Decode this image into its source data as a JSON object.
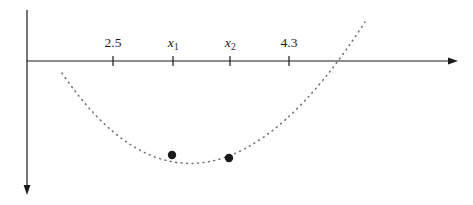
{
  "figure": {
    "name": "parabola-number-line-figure",
    "background_color": "#ffffff",
    "ink_color": "#1a1a1a",
    "curve_color": "#6b6b6b",
    "width": 473,
    "height": 205
  },
  "axes": {
    "horizontal": {
      "name": "x-axis",
      "y": 61,
      "x_start": 27,
      "x_end": 458,
      "arrow": "right"
    },
    "vertical": {
      "name": "y-axis",
      "x": 27,
      "y_start": 10,
      "y_end": 195,
      "arrow": "down"
    }
  },
  "ticks": [
    {
      "label": "2.5",
      "is_variable": false,
      "sub": "",
      "x": 113
    },
    {
      "label": "x",
      "is_variable": true,
      "sub": "1",
      "x": 173
    },
    {
      "label": "x",
      "is_variable": true,
      "sub": "2",
      "x": 230
    },
    {
      "label": "4.3",
      "is_variable": false,
      "sub": "",
      "x": 289
    }
  ],
  "tick_geometry": {
    "above": 5,
    "below": 5
  },
  "points": [
    {
      "name": "point-x1",
      "x": 172,
      "y": 155,
      "radius": 4.2
    },
    {
      "name": "point-x2",
      "x": 229,
      "y": 158,
      "radius": 4.2
    }
  ],
  "chart_data": {
    "type": "line",
    "title": "",
    "xlabel": "",
    "ylabel": "",
    "grid": false,
    "legend": null,
    "style": "dotted parabola opening upward, drawn below the x-axis",
    "tick_labels": [
      "2.5",
      "x_1",
      "x_2",
      "4.3"
    ],
    "tick_pixel_x": [
      113,
      173,
      230,
      289
    ],
    "curve": {
      "name": "dotted-parabola",
      "pixel_start": [
        62,
        73
      ],
      "pixel_end": [
        365,
        22
      ],
      "pixel_vertex": [
        207,
        162
      ],
      "dash_pattern": "0.9 4.6"
    },
    "marked_points": [
      {
        "label": "x_1",
        "pixel": [
          172,
          155
        ]
      },
      {
        "label": "x_2",
        "pixel": [
          229,
          158
        ]
      }
    ]
  }
}
